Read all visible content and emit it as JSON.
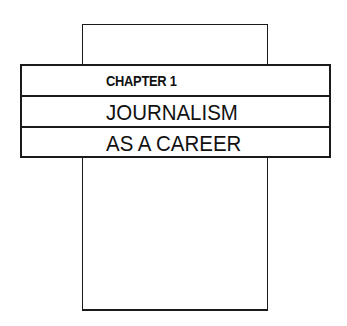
{
  "chapter_label": "CHAPTER 1",
  "title_lines": [
    "JOURNALISM",
    "AS A CAREER"
  ],
  "colors": {
    "ink": "#111111",
    "background": "#ffffff"
  }
}
